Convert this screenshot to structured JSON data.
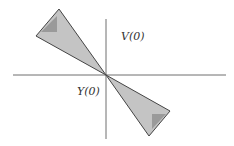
{
  "diagram": {
    "labels": {
      "v_axis": "V(0)",
      "y_axis": "Y(0)"
    },
    "colors": {
      "axis": "#6e6e6e",
      "outer_fill": "#c4c4c4",
      "inner_fill": "#9a9a9a",
      "edge": "#444444"
    },
    "shapes": [
      {
        "name": "upper-left-cone",
        "outer": [
          [
            59,
            9
          ],
          [
            36,
            36
          ],
          [
            106,
            75
          ]
        ],
        "inner": [
          [
            41,
            32
          ],
          [
            57,
            16
          ],
          [
            57,
            32
          ]
        ]
      },
      {
        "name": "lower-right-cone",
        "outer": [
          [
            106,
            75
          ],
          [
            170,
            111
          ],
          [
            149,
            136
          ]
        ],
        "inner": [
          [
            152,
            114
          ],
          [
            166,
            114
          ],
          [
            152,
            129
          ]
        ]
      }
    ]
  }
}
